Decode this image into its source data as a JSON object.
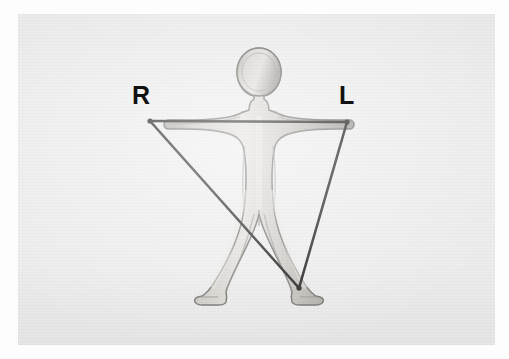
{
  "image": {
    "kind": "scanned-photograph",
    "description": "Grayscale line-drawing of a human figure in an A-pose with measurement lines drawn over it",
    "width": 509,
    "height": 359,
    "page_background_color": "#fdfdfd",
    "photo_background_color": "#ededed",
    "photo_rect": {
      "x": 18,
      "y": 14,
      "width": 477,
      "height": 331
    }
  },
  "labels": {
    "right": "R",
    "left": "L",
    "right_position": {
      "x": 132,
      "y": 83
    },
    "left_position": {
      "x": 339,
      "y": 83
    },
    "color": "#111111"
  },
  "figure": {
    "name": "human-body-outline",
    "fill_color": "#c9c6c1",
    "outline_color": "#6f6c68",
    "highlight_color": "#e4e2de",
    "shadow_color": "#8e8b86",
    "pose": "A-pose, arms horizontal outstretched, legs apart",
    "head": {
      "cx": 249,
      "cy": 79,
      "rx": 20,
      "ry": 25
    }
  },
  "overlay_lines": {
    "name": "measurement-triangle",
    "color": "#141414",
    "stroke_width": 2.6,
    "vertices": {
      "right_hand": {
        "x": 150,
        "y": 121
      },
      "left_hand": {
        "x": 347,
        "y": 122
      },
      "foot_apex": {
        "x": 299,
        "y": 288
      }
    },
    "segments": [
      {
        "name": "shoulder-span-line",
        "from": "right_hand",
        "to": "left_hand"
      },
      {
        "name": "right-hand-to-foot-line",
        "from": "right_hand",
        "to": "foot_apex"
      },
      {
        "name": "left-hand-to-foot-line",
        "from": "left_hand",
        "to": "foot_apex"
      }
    ]
  }
}
